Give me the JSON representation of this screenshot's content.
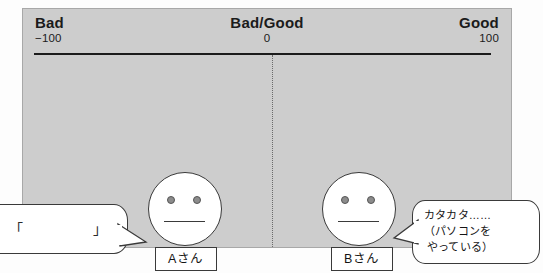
{
  "diagram": {
    "colors": {
      "panel_bg": "#cdcdcd",
      "bubble_bg": "#ffffff",
      "line": "#1b1b1b",
      "eye": "#8c8c8c"
    },
    "scale": {
      "left": {
        "word": "Bad",
        "value": "−100"
      },
      "center": {
        "word": "Bad/Good",
        "value": "0"
      },
      "right": {
        "word": "Good",
        "value": "100"
      }
    },
    "people": [
      {
        "id": "a",
        "name_label": "Aさん",
        "expression": "neutral"
      },
      {
        "id": "b",
        "name_label": "Bさん",
        "expression": "neutral"
      }
    ],
    "speech": {
      "left": {
        "quote_open": "「",
        "quote_close": "」",
        "text": ""
      },
      "right": {
        "line1": "カタカタ……",
        "line2": "（パソコンを",
        "line3": "やっている）"
      }
    }
  }
}
